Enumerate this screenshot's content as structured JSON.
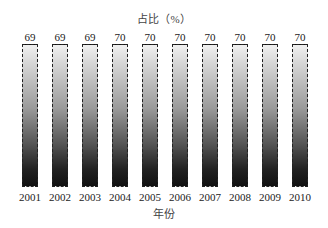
{
  "chart_data": {
    "type": "bar",
    "title": "占比（%）",
    "xlabel": "年份",
    "ylabel": "",
    "categories": [
      "2001",
      "2002",
      "2003",
      "2004",
      "2005",
      "2006",
      "2007",
      "2008",
      "2009",
      "2010"
    ],
    "values": [
      69,
      69,
      69,
      70,
      70,
      70,
      70,
      70,
      70,
      70
    ],
    "grid": false,
    "legend": null,
    "bar_style": "gradient light-to-dark, dashed border"
  }
}
